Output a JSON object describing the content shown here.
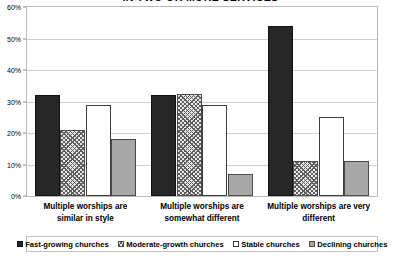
{
  "chart_data": {
    "type": "bar",
    "title": "IN TWO OR MORE SERVICES",
    "title_note": "title is cropped at the top edge of the screenshot; only the lower portion of the letters is visible",
    "xlabel": "",
    "ylabel": "",
    "ylim": [
      0,
      60
    ],
    "ytick_labels": [
      "0%",
      "10%",
      "20%",
      "30%",
      "40%",
      "50%",
      "60%"
    ],
    "ytick_values": [
      0,
      10,
      20,
      30,
      40,
      50,
      60
    ],
    "grid": true,
    "legend_position": "bottom",
    "categories": [
      "Multiple worships are similar in style",
      "Multiple worships are somewhat different",
      "Multiple worships are very different"
    ],
    "series": [
      {
        "name": "Fast-growing churches",
        "fill": "solid-black",
        "color": "#272727",
        "values": [
          32,
          32,
          54
        ]
      },
      {
        "name": "Moderate-growth churches",
        "fill": "crosshatch",
        "color": "#e8e8e8",
        "values": [
          21,
          32.5,
          11
        ]
      },
      {
        "name": "Stable churches",
        "fill": "white",
        "color": "#ffffff",
        "values": [
          29,
          29,
          25
        ]
      },
      {
        "name": "Declining churches",
        "fill": "solid-gray",
        "color": "#a8a8a8",
        "values": [
          18,
          7,
          11
        ]
      }
    ]
  },
  "category_lines": [
    [
      "Multiple worships are",
      "similar in style"
    ],
    [
      "Multiple worships are",
      "somewhat different"
    ],
    [
      "Multiple worships are very",
      "different"
    ]
  ]
}
